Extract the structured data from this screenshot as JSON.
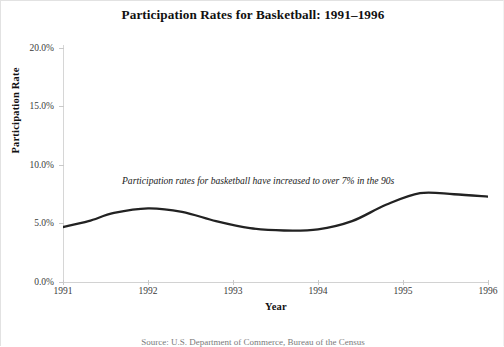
{
  "chart_data": {
    "type": "line",
    "title": "Participation Rates for Basketball: 1991–1996",
    "xlabel": "Year",
    "ylabel": "Participation Rate",
    "xlim": [
      1991,
      1996
    ],
    "ylim": [
      0,
      20
    ],
    "grid": false,
    "legend": "none",
    "y_tick_labels": [
      "20.0%",
      "15.0%",
      "10.0%",
      "5.0%",
      "0.0%"
    ],
    "y_tick_values": [
      20,
      15,
      10,
      5,
      0
    ],
    "x_tick_labels": [
      "1991",
      "1992",
      "1993",
      "1994",
      "1995",
      "1996"
    ],
    "x_tick_values": [
      1991,
      1992,
      1993,
      1994,
      1995,
      1996
    ],
    "series": [
      {
        "name": "Basketball participation rate",
        "color": "#222222",
        "x": [
          1991.0,
          1991.3,
          1991.6,
          1992.0,
          1992.4,
          1992.8,
          1993.2,
          1993.6,
          1994.0,
          1994.4,
          1994.8,
          1995.2,
          1995.6,
          1996.0
        ],
        "values": [
          4.7,
          5.2,
          5.9,
          6.3,
          6.0,
          5.2,
          4.6,
          4.4,
          4.5,
          5.2,
          6.6,
          7.6,
          7.5,
          7.3
        ]
      }
    ],
    "annotations": [
      {
        "text": "Participation rates for basketball have increased to over 7% in the 90s",
        "style": "italic",
        "x": 1992.1,
        "y": 8.9
      }
    ]
  },
  "footer": {
    "text": "Source: U.S. Department of Commerce, Bureau of the Census"
  }
}
